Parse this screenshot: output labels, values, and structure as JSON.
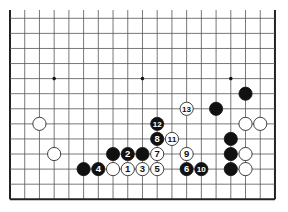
{
  "diagram": {
    "type": "go-board-fragment",
    "columns": 19,
    "rows_visible": 13,
    "edges": {
      "left": true,
      "right": true,
      "bottom": true,
      "top": false
    },
    "colors": {
      "background": "#ffffff",
      "line": "#555555",
      "edge": "#222222",
      "black": "#111111",
      "white": "#ffffff"
    },
    "star_points": [
      {
        "col": 3,
        "row": 4
      },
      {
        "col": 9,
        "row": 4
      },
      {
        "col": 15,
        "row": 4
      }
    ],
    "stones": [
      {
        "col": 2,
        "row": 7,
        "color": "white",
        "label": ""
      },
      {
        "col": 3,
        "row": 9,
        "color": "white",
        "label": ""
      },
      {
        "col": 5,
        "row": 10,
        "color": "black",
        "label": ""
      },
      {
        "col": 6,
        "row": 10,
        "color": "black",
        "label": "4"
      },
      {
        "col": 7,
        "row": 10,
        "color": "white",
        "label": ""
      },
      {
        "col": 8,
        "row": 10,
        "color": "white",
        "label": "1"
      },
      {
        "col": 9,
        "row": 10,
        "color": "white",
        "label": "3"
      },
      {
        "col": 10,
        "row": 10,
        "color": "white",
        "label": "5"
      },
      {
        "col": 12,
        "row": 10,
        "color": "black",
        "label": "6"
      },
      {
        "col": 13,
        "row": 10,
        "color": "black",
        "label": "10"
      },
      {
        "col": 15,
        "row": 10,
        "color": "black",
        "label": ""
      },
      {
        "col": 16,
        "row": 10,
        "color": "white",
        "label": ""
      },
      {
        "col": 7,
        "row": 9,
        "color": "black",
        "label": ""
      },
      {
        "col": 8,
        "row": 9,
        "color": "black",
        "label": "2"
      },
      {
        "col": 9,
        "row": 9,
        "color": "black",
        "label": ""
      },
      {
        "col": 10,
        "row": 9,
        "color": "white",
        "label": "7"
      },
      {
        "col": 12,
        "row": 9,
        "color": "white",
        "label": "9"
      },
      {
        "col": 15,
        "row": 9,
        "color": "black",
        "label": ""
      },
      {
        "col": 16,
        "row": 9,
        "color": "white",
        "label": ""
      },
      {
        "col": 10,
        "row": 8,
        "color": "black",
        "label": "8"
      },
      {
        "col": 11,
        "row": 8,
        "color": "white",
        "label": "11"
      },
      {
        "col": 15,
        "row": 8,
        "color": "black",
        "label": ""
      },
      {
        "col": 10,
        "row": 7,
        "color": "black",
        "label": "12"
      },
      {
        "col": 16,
        "row": 7,
        "color": "white",
        "label": ""
      },
      {
        "col": 17,
        "row": 7,
        "color": "white",
        "label": ""
      },
      {
        "col": 12,
        "row": 6,
        "color": "white",
        "label": "13"
      },
      {
        "col": 14,
        "row": 6,
        "color": "black",
        "label": ""
      },
      {
        "col": 16,
        "row": 5,
        "color": "black",
        "label": ""
      }
    ]
  }
}
